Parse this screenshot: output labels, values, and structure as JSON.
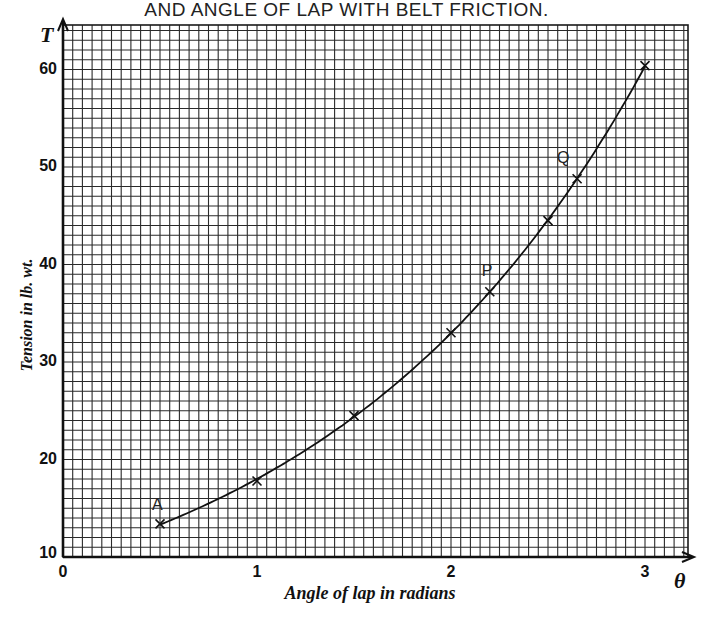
{
  "chart_data": {
    "type": "line",
    "title": "AND ANGLE OF LAP WITH BELT FRICTION.",
    "xlabel": "Angle of lap in radians",
    "ylabel": "Tension in lb. wt.",
    "x_axis_symbol": "θ",
    "y_axis_symbol": "T",
    "xlim": [
      0,
      3.2
    ],
    "ylim": [
      10,
      64
    ],
    "x_ticks": [
      "0",
      "1",
      "2",
      "3"
    ],
    "y_ticks": [
      "10",
      "20",
      "30",
      "40",
      "50",
      "60"
    ],
    "grid": true,
    "series": [
      {
        "name": "T = T0·e^(μθ)",
        "x": [
          0.5,
          1.0,
          1.5,
          2.0,
          2.2,
          2.5,
          2.65,
          3.0
        ],
        "values": [
          13.4,
          17.8,
          24.5,
          33.0,
          37.2,
          44.5,
          48.8,
          60.4
        ],
        "marker": "x"
      }
    ],
    "annotations": [
      {
        "label": "A",
        "x": 0.5,
        "y": 13.4
      },
      {
        "label": "P",
        "x": 2.2,
        "y": 37.2
      },
      {
        "label": "Q",
        "x": 2.65,
        "y": 48.8
      }
    ]
  }
}
